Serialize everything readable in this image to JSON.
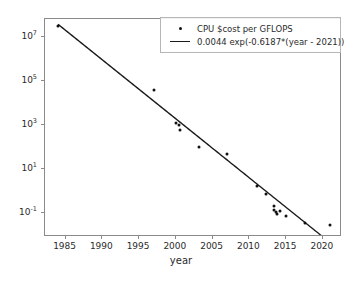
{
  "chart_data": {
    "type": "scatter",
    "title": "",
    "xlabel": "year",
    "ylabel": "",
    "yscale": "log",
    "xlim": [
      1982.2,
      2022.6
    ],
    "ylim": [
      0.0085,
      68000000
    ],
    "grid": false,
    "legend_position": "upper right",
    "xticks": [
      1985,
      1990,
      1995,
      2000,
      2005,
      2010,
      2015,
      2020
    ],
    "xticklabels": [
      "1985",
      "1990",
      "1995",
      "2000",
      "2005",
      "2010",
      "2015",
      "2020"
    ],
    "yticks": [
      0.1,
      10,
      1000,
      100000,
      10000000
    ],
    "yticklabels": [
      "10⁻¹",
      "10¹",
      "10³",
      "10⁵",
      "10⁷"
    ],
    "ytick_mantissa": [
      "10",
      "10",
      "10",
      "10",
      "10"
    ],
    "ytick_exponent": [
      "-1",
      "1",
      "3",
      "5",
      "7"
    ],
    "series": [
      {
        "name": "CPU $cost per GFLOPS",
        "type": "scatter",
        "marker": "point",
        "color": "#111111",
        "points": [
          {
            "x": 1984.0,
            "y": 33000000
          },
          {
            "x": 1997.0,
            "y": 42000
          },
          {
            "x": 2000.0,
            "y": 1300
          },
          {
            "x": 2000.4,
            "y": 1000
          },
          {
            "x": 2000.6,
            "y": 640
          },
          {
            "x": 2003.1,
            "y": 100
          },
          {
            "x": 2007.0,
            "y": 50
          },
          {
            "x": 2011.0,
            "y": 1.8
          },
          {
            "x": 2012.2,
            "y": 0.73
          },
          {
            "x": 2013.3,
            "y": 0.22
          },
          {
            "x": 2013.4,
            "y": 0.15
          },
          {
            "x": 2013.6,
            "y": 0.12
          },
          {
            "x": 2013.7,
            "y": 0.095
          },
          {
            "x": 2014.1,
            "y": 0.13
          },
          {
            "x": 2015.0,
            "y": 0.078
          },
          {
            "x": 2017.5,
            "y": 0.037
          },
          {
            "x": 2021.0,
            "y": 0.031
          }
        ]
      },
      {
        "name": "0.0044 exp(-0.6187*(year - 2021))",
        "type": "line",
        "color": "#1a1a1a",
        "fit": {
          "a": 0.0044,
          "b": -0.6187,
          "x0": 2021
        },
        "x_start": 1984.0,
        "x_end": 2022.4
      }
    ]
  },
  "legend": {
    "entries": [
      {
        "key": "marker-dot",
        "label": "CPU $cost per GFLOPS"
      },
      {
        "key": "line-segment",
        "label": "0.0044 exp(-0.6187*(year - 2021))"
      }
    ]
  },
  "axis": {
    "xlabel": "year"
  },
  "style": {
    "background": "#ffffff",
    "frame_color": "#8a8a8a",
    "marker_color": "#111111",
    "line_color": "#1a1a1a",
    "text_color": "#2b2b2b"
  }
}
